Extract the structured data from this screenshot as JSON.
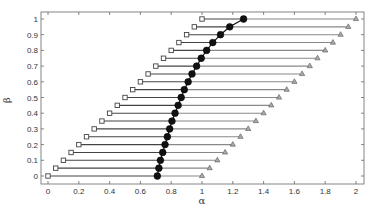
{
  "chart_data": {
    "type": "scatter",
    "title": "",
    "xlabel": "α",
    "ylabel": "β",
    "xlim": [
      -0.05,
      2.05
    ],
    "ylim": [
      -0.05,
      1.05
    ],
    "xticks": [
      0,
      0.2,
      0.4,
      0.6,
      0.8,
      1,
      1.2,
      1.4,
      1.6,
      1.8,
      2
    ],
    "xtick_labels": [
      "0",
      "0.2",
      "0.4",
      "0.6",
      "0.8",
      "1",
      "1.2",
      "1.4",
      "1.6",
      "1.8",
      "2"
    ],
    "yticks": [
      0,
      0.1,
      0.2,
      0.3,
      0.4,
      0.5,
      0.6,
      0.7,
      0.8,
      0.9,
      1
    ],
    "ytick_labels": [
      "0",
      "0.1",
      "0.2",
      "0.3",
      "0.4",
      "0.5",
      "0.6",
      "0.7",
      "0.8",
      "0.9",
      "1"
    ],
    "grid": false,
    "legend": null,
    "beta": [
      0,
      0.05,
      0.1,
      0.15,
      0.2,
      0.25,
      0.3,
      0.35,
      0.4,
      0.45,
      0.5,
      0.55,
      0.6,
      0.65,
      0.7,
      0.75,
      0.8,
      0.85,
      0.9,
      0.95,
      1
    ],
    "series": [
      {
        "name": "lower bound (square)",
        "marker": "square",
        "color": "#555555",
        "values": [
          0,
          0.05,
          0.1,
          0.15,
          0.2,
          0.25,
          0.3,
          0.35,
          0.4,
          0.45,
          0.5,
          0.55,
          0.6,
          0.65,
          0.7,
          0.75,
          0.8,
          0.85,
          0.9,
          0.95,
          1
        ]
      },
      {
        "name": "solution (circle)",
        "marker": "circle",
        "color": "#111111",
        "values": [
          0.71,
          0.72,
          0.73,
          0.745,
          0.76,
          0.775,
          0.79,
          0.805,
          0.825,
          0.845,
          0.865,
          0.885,
          0.91,
          0.935,
          0.965,
          0.995,
          1.03,
          1.07,
          1.12,
          1.18,
          1.27
        ]
      },
      {
        "name": "upper bound (triangle)",
        "marker": "triangle",
        "color": "#777777",
        "values": [
          1,
          1.05,
          1.1,
          1.15,
          1.2,
          1.25,
          1.3,
          1.35,
          1.4,
          1.45,
          1.5,
          1.55,
          1.6,
          1.65,
          1.7,
          1.75,
          1.8,
          1.85,
          1.9,
          1.95,
          2
        ]
      }
    ],
    "colors": {
      "left_segment": "#444444",
      "right_segment": "#888888",
      "frame": "#666666"
    }
  }
}
